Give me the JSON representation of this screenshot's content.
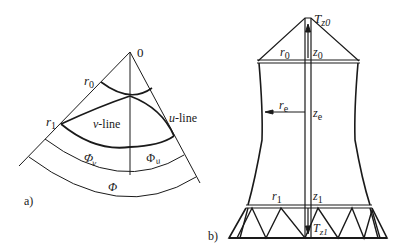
{
  "panel_a": {
    "label": "a)",
    "origin": "0",
    "r0": {
      "base": "r",
      "sub": "0"
    },
    "r1": {
      "base": "r",
      "sub": "1"
    },
    "v_line": {
      "italic": "v",
      "text": "-line"
    },
    "u_line": {
      "italic": "u",
      "text": "-line"
    },
    "phi_v": {
      "base": "Φ",
      "sub": "v"
    },
    "phi_u": {
      "base": "Φ",
      "sub": "u"
    },
    "phi": "Φ"
  },
  "panel_b": {
    "label": "b)",
    "Tz0": {
      "base": "T",
      "sub": "z0"
    },
    "Tz1": {
      "base": "T",
      "sub": "z1"
    },
    "r0": {
      "base": "r",
      "sub": "0"
    },
    "z0": {
      "base": "z",
      "sub": "0"
    },
    "re": {
      "base": "r",
      "sub": "e"
    },
    "ze": {
      "base": "z",
      "sub": "e"
    },
    "r1": {
      "base": "r",
      "sub": "1"
    },
    "z1": {
      "base": "z",
      "sub": "1"
    }
  },
  "colors": {
    "ink": "#1a1a1a",
    "background": "#ffffff"
  }
}
